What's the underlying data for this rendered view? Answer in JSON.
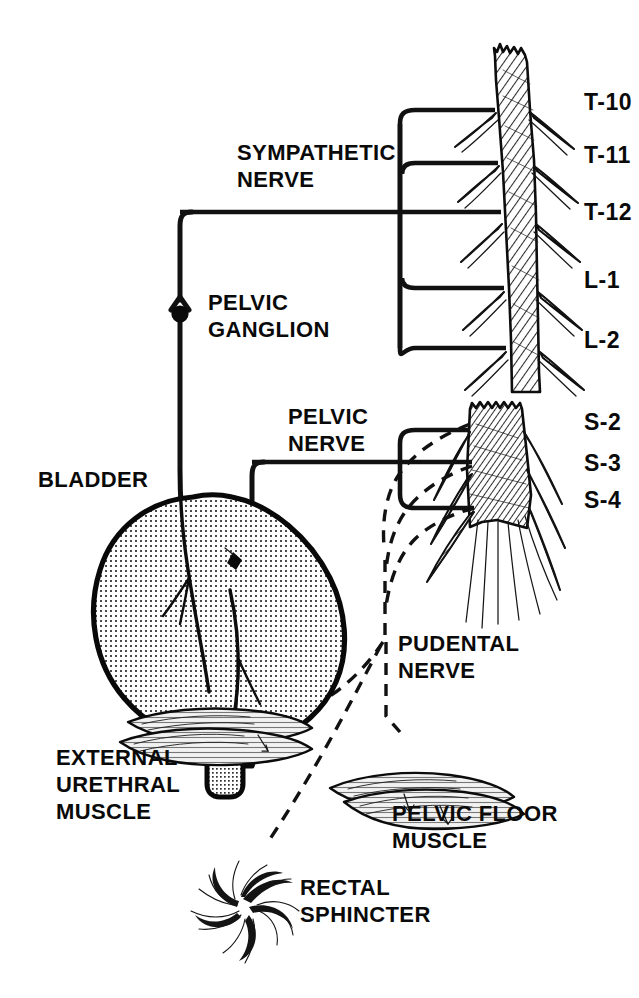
{
  "figure": {
    "background_color": "#ffffff",
    "ink_color": "#111111",
    "width": 639,
    "height": 998
  },
  "spinal_levels": {
    "sympathetic": [
      {
        "id": "t10",
        "label": "T-10",
        "x": 584,
        "y": 110
      },
      {
        "id": "t11",
        "label": "T-11",
        "x": 584,
        "y": 163
      },
      {
        "id": "t12",
        "label": "T-12",
        "x": 584,
        "y": 220
      },
      {
        "id": "l1",
        "label": "L-1",
        "x": 584,
        "y": 288
      },
      {
        "id": "l2",
        "label": "L-2",
        "x": 584,
        "y": 348
      }
    ],
    "parasympathetic": [
      {
        "id": "s2",
        "label": "S-2",
        "x": 584,
        "y": 430
      },
      {
        "id": "s3",
        "label": "S-3",
        "x": 584,
        "y": 471
      },
      {
        "id": "s4",
        "label": "S-4",
        "x": 584,
        "y": 508
      }
    ]
  },
  "nerve_labels": [
    {
      "id": "sympathetic-nerve",
      "lines": [
        "SYMPATHETIC",
        "NERVE"
      ],
      "x": 237,
      "y": 160
    },
    {
      "id": "pelvic-ganglion",
      "lines": [
        "PELVIC",
        "GANGLION"
      ],
      "x": 208,
      "y": 310
    },
    {
      "id": "pelvic-nerve",
      "lines": [
        "PELVIC",
        "NERVE"
      ],
      "x": 288,
      "y": 424
    },
    {
      "id": "pudental-nerve",
      "lines": [
        "PUDENTAL",
        "NERVE"
      ],
      "x": 398,
      "y": 651
    }
  ],
  "organ_labels": [
    {
      "id": "bladder",
      "lines": [
        "BLADDER"
      ],
      "x": 38,
      "y": 487
    },
    {
      "id": "external-urethral-muscle",
      "lines": [
        "EXTERNAL",
        "URETHRAL",
        "MUSCLE"
      ],
      "x": 56,
      "y": 765
    },
    {
      "id": "pelvic-floor-muscle",
      "lines": [
        "PELVIC FLOOR",
        "MUSCLE"
      ],
      "x": 392,
      "y": 821
    },
    {
      "id": "rectal-sphincter",
      "lines": [
        "RECTAL",
        "SPHINCTER"
      ],
      "x": 300,
      "y": 895
    }
  ],
  "legend": {
    "solid_line_meaning": "autonomic nerve pathway",
    "dashed_line_meaning": "pudendal (somatic) nerve pathway"
  }
}
